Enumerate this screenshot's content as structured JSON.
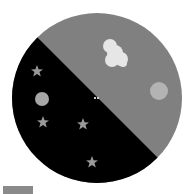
{
  "dial": {
    "center": [
      97,
      98
    ],
    "radius": 85,
    "day_color": "#808080",
    "night_color": "#000000",
    "split_line": [
      [
        38,
        37
      ],
      [
        158,
        157
      ]
    ]
  },
  "day_side": {
    "cloud": {
      "color": "#e6e6e6",
      "bbox": [
        103,
        40,
        127,
        67
      ]
    },
    "sun": {
      "center": [
        159,
        91
      ],
      "radius": 9,
      "color": "#b3b3b3"
    }
  },
  "night_side": {
    "moon": {
      "center": [
        42,
        99
      ],
      "radius": 7,
      "color": "#a6a6a6"
    },
    "stars": [
      {
        "center": [
          37,
          71
        ],
        "size": 6
      },
      {
        "center": [
          43,
          122
        ],
        "size": 6
      },
      {
        "center": [
          83,
          124
        ],
        "size": 6
      },
      {
        "center": [
          92,
          162
        ],
        "size": 6
      }
    ],
    "star_color": "#999999"
  },
  "center_marker": {
    "center": [
      96,
      98
    ],
    "color": "#cccccc"
  },
  "legend": {
    "swatch_color": "#8a8a8a"
  }
}
